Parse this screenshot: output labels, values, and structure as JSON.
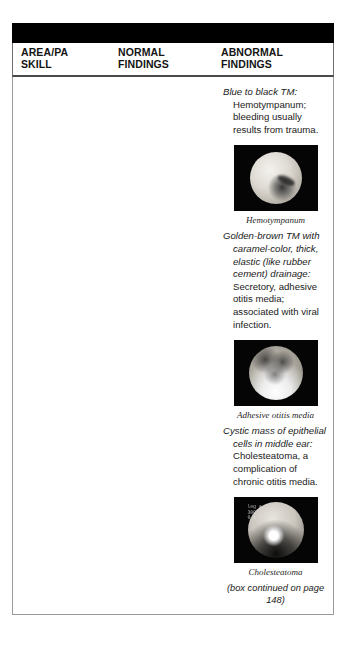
{
  "table": {
    "columns": [
      {
        "line1": "AREA/PA",
        "line2": "SKILL"
      },
      {
        "line1": "NORMAL",
        "line2": "FINDINGS"
      },
      {
        "line1": "ABNORMAL",
        "line2": "FINDINGS"
      }
    ]
  },
  "abnormal_findings": [
    {
      "lead": "Blue to black TM:",
      "body": " Hemotympanum; bleeding usually results from trauma."
    },
    {
      "lead": "Golden-brown TM with caramel-color, thick, elastic (like rubber cement) drainage:",
      "body": " Secretory, adhesive otitis media; associated with viral infection."
    },
    {
      "lead": "Cystic mass of epithelial cells in middle ear:",
      "body": " Cholesteatoma, a complication of chronic otitis media."
    }
  ],
  "photos": [
    {
      "caption": "Hemotympanum",
      "overlay": ""
    },
    {
      "caption": "Adhesive otitis media",
      "overlay": ""
    },
    {
      "caption": "Cholesteatoma",
      "overlay": "leg a\n300\n0 1 0"
    }
  ],
  "footer": {
    "continued": "(box continued on page 148)"
  },
  "colors": {
    "header_bar": "#000000",
    "rule": "#4a4a4a",
    "border": "#9a9a9a",
    "text": "#1a1a1a",
    "page_background": "#ffffff"
  }
}
